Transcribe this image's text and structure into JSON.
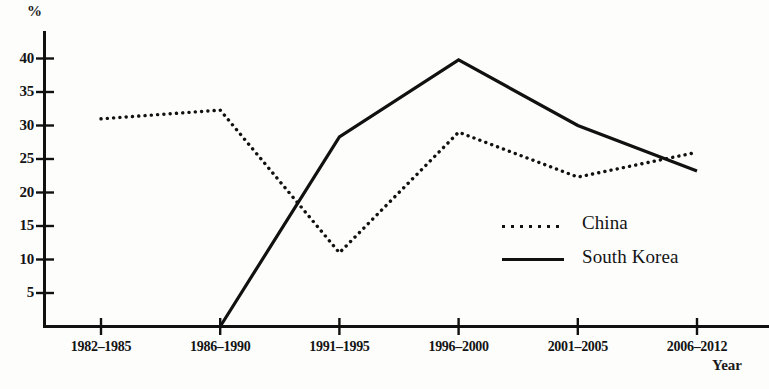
{
  "chart_data": {
    "type": "line",
    "title": "",
    "xlabel": "Year",
    "ylabel": "%",
    "categories": [
      "1982–1985",
      "1986–1990",
      "1991–1995",
      "1996–2000",
      "2001–2005",
      "2006–2012"
    ],
    "yticks": [
      5,
      10,
      15,
      20,
      25,
      30,
      35,
      40
    ],
    "ylim": [
      0,
      44
    ],
    "grid": false,
    "legend_position": "center-right",
    "series": [
      {
        "name": "China",
        "style": "dotted",
        "color": "#111111",
        "values": [
          31.0,
          32.3,
          11.0,
          29.0,
          22.3,
          26.0
        ]
      },
      {
        "name": "South Korea",
        "style": "solid",
        "color": "#111111",
        "values": [
          null,
          0.0,
          28.3,
          39.8,
          30.0,
          23.2
        ]
      }
    ]
  },
  "axes": {
    "y_unit": "%",
    "x_name": "Year"
  },
  "legend": {
    "items": [
      {
        "label": "China",
        "style": "dotted"
      },
      {
        "label": "South Korea",
        "style": "solid"
      }
    ]
  }
}
